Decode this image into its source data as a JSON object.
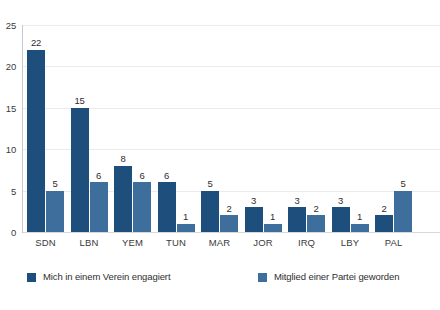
{
  "chart_data": {
    "type": "bar",
    "title": "",
    "subtitle": "",
    "xlabel": "",
    "ylabel": "",
    "ylim": [
      0,
      25
    ],
    "yticks": [
      0,
      5,
      10,
      15,
      20,
      25
    ],
    "ytick_labels": [
      "0",
      "5",
      "10",
      "15",
      "20",
      "25"
    ],
    "grid": true,
    "grid_axis": "y",
    "legend_position": "bottom",
    "categories": [
      "SDN",
      "LBN",
      "YEM",
      "TUN",
      "MAR",
      "JOR",
      "IRQ",
      "LBY",
      "PAL"
    ],
    "series": [
      {
        "name": "Mich in einem Verein engagiert",
        "color": "#1d4e7c",
        "values": [
          22,
          15,
          8,
          6,
          5,
          3,
          3,
          3,
          2
        ],
        "labels": [
          "22",
          "15",
          "8",
          "6",
          "5",
          "3",
          "3",
          "3",
          "2"
        ]
      },
      {
        "name": "Mitglied einer Partei geworden",
        "color": "#3e6e9b",
        "values": [
          5,
          6,
          6,
          1,
          2,
          1,
          2,
          1,
          5
        ],
        "labels": [
          "5",
          "6",
          "6",
          "1",
          "2",
          "1",
          "2",
          "1",
          "5"
        ]
      }
    ]
  },
  "colors": {
    "series_dark_blue": "#1d4e7c",
    "series_light_blue": "#3e6e9b",
    "gridline": "#ebebed",
    "axis": "#c9c9cc",
    "text": "#3a3a3c",
    "background": "#ffffff"
  }
}
